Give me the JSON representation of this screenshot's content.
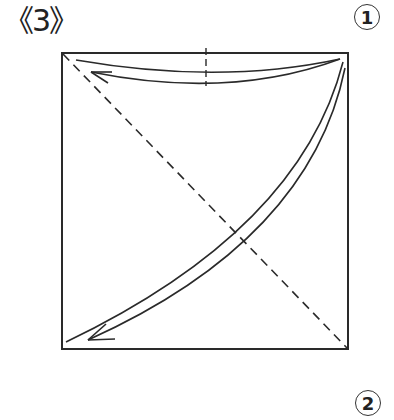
{
  "step_label": "《3》",
  "markers": [
    {
      "id": "1",
      "label": "1"
    },
    {
      "id": "2",
      "label": "2"
    }
  ],
  "diagram": {
    "type": "origami-fold-instruction",
    "square": {
      "x": 62,
      "y": 53,
      "width": 286,
      "height": 296
    },
    "fold_lines": [
      "diagonal-valley-fold-top-left-to-bottom-right",
      "vertical-center-crease-top"
    ],
    "arrows": [
      "fold-top-right-corner-to-top-left",
      "fold-top-right-corner-to-bottom-left"
    ],
    "colors": {
      "stroke": "#2a2a2a",
      "background": "#ffffff"
    }
  }
}
